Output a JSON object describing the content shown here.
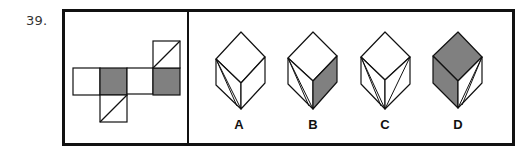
{
  "question": {
    "number": "39."
  },
  "colors": {
    "stroke": "#111111",
    "shade": "#808080",
    "blank": "#ffffff"
  },
  "net": {
    "squares": [
      {
        "id": "row-1",
        "x": 73,
        "y": 68,
        "size": 27,
        "shaded": false,
        "diagonal": null
      },
      {
        "id": "row-2",
        "x": 100,
        "y": 68,
        "size": 27,
        "shaded": true,
        "diagonal": null
      },
      {
        "id": "row-3",
        "x": 127,
        "y": 68,
        "size": 26,
        "shaded": false,
        "diagonal": null
      },
      {
        "id": "row-4",
        "x": 153,
        "y": 68,
        "size": 27,
        "shaded": true,
        "diagonal": null
      },
      {
        "id": "top",
        "x": 153,
        "y": 41,
        "size": 27,
        "shaded": false,
        "diagonal": "bl-tr"
      },
      {
        "id": "bottom",
        "x": 100,
        "y": 95,
        "size": 27,
        "shaded": false,
        "diagonal": "bl-tr"
      }
    ]
  },
  "options": [
    {
      "label": "A",
      "label_x": 239,
      "label_y": 129,
      "top": [
        241,
        32
      ],
      "left": [
        216,
        59
      ],
      "right": [
        265,
        57
      ],
      "center": [
        241,
        83
      ],
      "left_bottom": [
        216,
        85
      ],
      "right_bottom": [
        265,
        83
      ],
      "bottom": [
        241,
        109
      ],
      "top_shaded": false,
      "left_shaded": false,
      "right_shaded": false,
      "lines": [
        [
          [
            216,
            59
          ],
          [
            241,
            109
          ]
        ],
        [
          [
            216,
            59
          ],
          [
            237,
            106
          ]
        ]
      ]
    },
    {
      "label": "B",
      "label_x": 313,
      "label_y": 129,
      "top": [
        313,
        32
      ],
      "left": [
        288,
        58
      ],
      "right": [
        337,
        56
      ],
      "center": [
        313,
        81
      ],
      "left_bottom": [
        288,
        84
      ],
      "right_bottom": [
        337,
        82
      ],
      "bottom": [
        313,
        109
      ],
      "top_shaded": false,
      "left_shaded": false,
      "right_shaded": true,
      "lines": [
        [
          [
            288,
            58
          ],
          [
            313,
            109
          ]
        ],
        [
          [
            288,
            58
          ],
          [
            309,
            106
          ]
        ]
      ]
    },
    {
      "label": "C",
      "label_x": 385,
      "label_y": 129,
      "top": [
        385,
        32
      ],
      "left": [
        361,
        57
      ],
      "right": [
        410,
        57
      ],
      "center": [
        385,
        80
      ],
      "left_bottom": [
        361,
        84
      ],
      "right_bottom": [
        410,
        84
      ],
      "bottom": [
        385,
        109
      ],
      "top_shaded": false,
      "left_shaded": false,
      "right_shaded": false,
      "lines": [
        [
          [
            361,
            57
          ],
          [
            385,
            109
          ]
        ],
        [
          [
            361,
            57
          ],
          [
            381,
            106
          ]
        ],
        [
          [
            410,
            57
          ],
          [
            385,
            109
          ]
        ]
      ]
    },
    {
      "label": "D",
      "label_x": 458,
      "label_y": 129,
      "top": [
        458,
        32
      ],
      "left": [
        433,
        56
      ],
      "right": [
        482,
        57
      ],
      "center": [
        458,
        81
      ],
      "left_bottom": [
        433,
        83
      ],
      "right_bottom": [
        482,
        83
      ],
      "bottom": [
        458,
        108
      ],
      "top_shaded": true,
      "left_shaded": true,
      "right_shaded": false,
      "lines": [
        [
          [
            482,
            57
          ],
          [
            458,
            108
          ]
        ],
        [
          [
            482,
            57
          ],
          [
            462,
            105
          ]
        ]
      ]
    }
  ]
}
